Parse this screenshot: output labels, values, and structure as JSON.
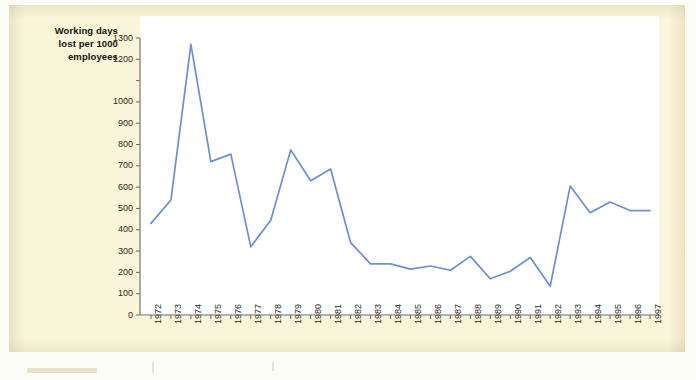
{
  "axis_title": {
    "line1": "Working days",
    "line2": "lost per 1000",
    "line3": "employees"
  },
  "colors": {
    "series_line": "#6c8fd1",
    "axis": "#6b6a5e",
    "panel_background": "#faf6d9",
    "plot_background": "#ffffff",
    "text": "#2b2a22"
  },
  "chart_data": {
    "type": "line",
    "title": "Working days lost per 1000 employees",
    "xlabel": "",
    "ylabel": "Working days lost per 1000 employees",
    "grid": false,
    "legend": "none",
    "ylim": [
      0,
      1300
    ],
    "ytick_labels": [
      "1300",
      "1200",
      "1000",
      "900",
      "800",
      "700",
      "600",
      "500",
      "400",
      "300",
      "200",
      "100",
      "0"
    ],
    "ytick_values": [
      1300,
      1200,
      1100,
      1000,
      900,
      800,
      700,
      600,
      500,
      400,
      300,
      200,
      100,
      0
    ],
    "categories": [
      "1972",
      "1973",
      "1974",
      "1975",
      "1976",
      "1977",
      "1978",
      "1979",
      "1980",
      "1981",
      "1982",
      "1983",
      "1984",
      "1985",
      "1986",
      "1987",
      "1988",
      "1989",
      "1990",
      "1991",
      "1992",
      "1993",
      "1994",
      "1995",
      "1996",
      "1997"
    ],
    "series": [
      {
        "name": "Working days lost per 1000 employees",
        "color": "#6c8fd1",
        "values": [
          430,
          540,
          1270,
          720,
          755,
          320,
          445,
          775,
          630,
          685,
          340,
          240,
          240,
          215,
          230,
          210,
          275,
          170,
          205,
          270,
          135,
          605,
          480,
          530,
          490,
          490
        ]
      }
    ]
  }
}
